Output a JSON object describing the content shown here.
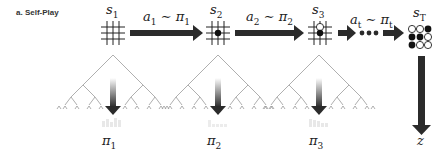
{
  "panel_label": "a. Self-Play",
  "states": [
    {
      "name": "s",
      "sub": "1"
    },
    {
      "name": "s",
      "sub": "2"
    },
    {
      "name": "s",
      "sub": "3"
    },
    {
      "name": "s",
      "sub": "T"
    }
  ],
  "actions": [
    {
      "a": "a",
      "a_sub": "1",
      "rel": " ∼ ",
      "pi": "π",
      "pi_sub": "1"
    },
    {
      "a": "a",
      "a_sub": "2",
      "rel": " ∼ ",
      "pi": "π",
      "pi_sub": "2"
    },
    {
      "a": "a",
      "a_sub": "t",
      "rel": " ∼ ",
      "pi": "π",
      "pi_sub": "t"
    }
  ],
  "policies": [
    {
      "name": "π",
      "sub": "1"
    },
    {
      "name": "π",
      "sub": "2"
    },
    {
      "name": "π",
      "sub": "3"
    }
  ],
  "outcome": "z",
  "colors": {
    "arrow": "#2b2b2b",
    "tree": "#9a9a9a",
    "grid": "#222222"
  }
}
